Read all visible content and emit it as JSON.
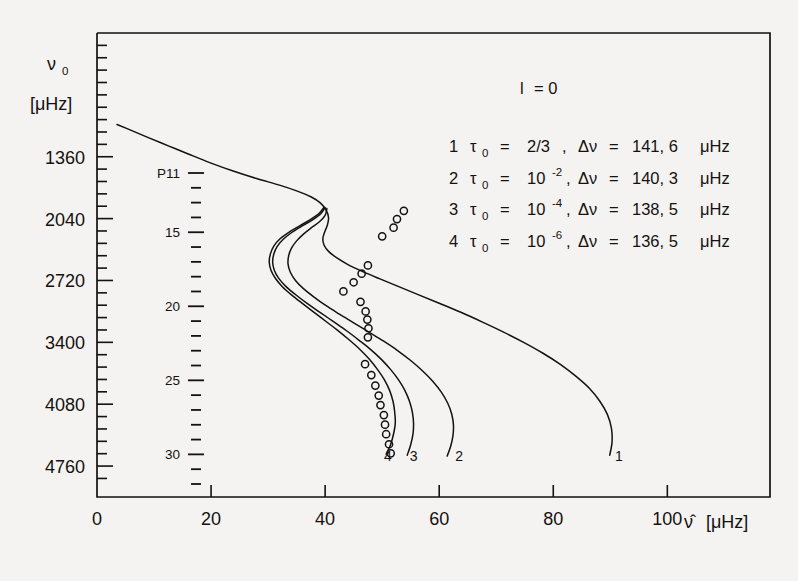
{
  "figure": {
    "background": "#f4f3f1",
    "ink": "#14110f"
  },
  "chart_data": {
    "type": "line",
    "title": "",
    "subtitle": "",
    "xlabel": "ν̂ [μHz]",
    "ylabel": "ν₀ [μHz]",
    "ylabel_line1": "ν",
    "ylabel_line1_sub": "0",
    "ylabel_line2": "[μHz]",
    "xlabel_hat": "ν̂",
    "xlabel_unit": "[μHz]",
    "xlim": [
      0,
      118
    ],
    "ylim": [
      0,
      5100
    ],
    "xticks": [
      0,
      20,
      40,
      60,
      80,
      100
    ],
    "xticklabels": [
      "0",
      "20",
      "40",
      "60",
      "80",
      "100"
    ],
    "yticks": [
      1360,
      2040,
      2720,
      3400,
      4080,
      4760
    ],
    "yticklabels": [
      "1360",
      "2040",
      "2720",
      "3400",
      "4080",
      "4760"
    ],
    "y_minor_step": 136,
    "grid": false,
    "legend_position": "upper-right-inside",
    "annotation_l": "l = 0",
    "inner_scale": {
      "name": "P11",
      "label_prefix": "P",
      "ticks": [
        11,
        12,
        13,
        14,
        15,
        16,
        17,
        18,
        19,
        20,
        21,
        22,
        23,
        24,
        25,
        26,
        27,
        28,
        29,
        30,
        31,
        32
      ],
      "labeled": [
        {
          "n": 11,
          "text": "P11"
        },
        {
          "n": 15,
          "text": "15"
        },
        {
          "n": 20,
          "text": "20"
        },
        {
          "n": 25,
          "text": "25"
        },
        {
          "n": 30,
          "text": "30"
        }
      ]
    },
    "series": [
      {
        "name": "1",
        "label": "1",
        "tau0": "2/3",
        "delta_nu": "141,6",
        "legend": "1  τ₀ = 2/3 ,  Δν = 141,6 μHz",
        "points": [
          [
            3.5,
            1005
          ],
          [
            6.0,
            1070
          ],
          [
            9.0,
            1150
          ],
          [
            12.5,
            1240
          ],
          [
            16.0,
            1330
          ],
          [
            20.0,
            1430
          ],
          [
            24.0,
            1520
          ],
          [
            28.0,
            1600
          ],
          [
            32.0,
            1672
          ],
          [
            35.0,
            1735
          ],
          [
            37.5,
            1800
          ],
          [
            39.2,
            1870
          ],
          [
            40.2,
            1950
          ],
          [
            40.6,
            2030
          ],
          [
            40.4,
            2110
          ],
          [
            39.9,
            2190
          ],
          [
            39.6,
            2260
          ],
          [
            39.8,
            2330
          ],
          [
            40.6,
            2400
          ],
          [
            42.0,
            2470
          ],
          [
            44.0,
            2545
          ],
          [
            46.5,
            2620
          ],
          [
            49.5,
            2700
          ],
          [
            52.8,
            2785
          ],
          [
            56.3,
            2875
          ],
          [
            60.0,
            2970
          ],
          [
            63.8,
            3070
          ],
          [
            67.5,
            3175
          ],
          [
            71.2,
            3285
          ],
          [
            74.8,
            3400
          ],
          [
            78.2,
            3520
          ],
          [
            81.3,
            3645
          ],
          [
            84.0,
            3775
          ],
          [
            86.4,
            3910
          ],
          [
            88.2,
            4050
          ],
          [
            89.5,
            4195
          ],
          [
            90.2,
            4345
          ],
          [
            90.3,
            4500
          ],
          [
            89.9,
            4640
          ]
        ]
      },
      {
        "name": "2",
        "label": "2",
        "tau0": "10⁻²",
        "delta_nu": "140,3",
        "legend": "2  τ₀ = 10⁻² ,  Δν = 140,3 μHz",
        "points": [
          [
            40.3,
            1930
          ],
          [
            40.0,
            2005
          ],
          [
            39.0,
            2075
          ],
          [
            37.6,
            2140
          ],
          [
            36.2,
            2210
          ],
          [
            35.0,
            2285
          ],
          [
            34.1,
            2365
          ],
          [
            33.6,
            2450
          ],
          [
            33.5,
            2540
          ],
          [
            33.9,
            2630
          ],
          [
            34.8,
            2720
          ],
          [
            36.2,
            2810
          ],
          [
            38.0,
            2900
          ],
          [
            40.1,
            2995
          ],
          [
            42.5,
            3090
          ],
          [
            45.0,
            3185
          ],
          [
            47.6,
            3285
          ],
          [
            50.2,
            3385
          ],
          [
            52.7,
            3490
          ],
          [
            55.0,
            3600
          ],
          [
            57.1,
            3715
          ],
          [
            58.9,
            3830
          ],
          [
            60.4,
            3950
          ],
          [
            61.5,
            4070
          ],
          [
            62.2,
            4190
          ],
          [
            62.5,
            4310
          ],
          [
            62.4,
            4430
          ],
          [
            62.0,
            4545
          ],
          [
            61.4,
            4650
          ]
        ]
      },
      {
        "name": "3",
        "label": "3",
        "tau0": "10⁻⁴",
        "delta_nu": "138,5",
        "legend": "3  τ₀ = 10⁻⁴ ,  Δν = 138,5 μHz",
        "points": [
          [
            40.0,
            1920
          ],
          [
            39.2,
            1990
          ],
          [
            37.8,
            2055
          ],
          [
            36.0,
            2120
          ],
          [
            34.2,
            2190
          ],
          [
            32.7,
            2265
          ],
          [
            31.6,
            2345
          ],
          [
            31.0,
            2430
          ],
          [
            30.8,
            2520
          ],
          [
            31.1,
            2610
          ],
          [
            31.9,
            2700
          ],
          [
            33.2,
            2790
          ],
          [
            34.9,
            2880
          ],
          [
            36.9,
            2975
          ],
          [
            39.1,
            3070
          ],
          [
            41.4,
            3170
          ],
          [
            43.7,
            3270
          ],
          [
            45.9,
            3375
          ],
          [
            48.0,
            3480
          ],
          [
            49.9,
            3590
          ],
          [
            51.5,
            3700
          ],
          [
            52.9,
            3815
          ],
          [
            54.0,
            3930
          ],
          [
            54.8,
            4050
          ],
          [
            55.3,
            4170
          ],
          [
            55.5,
            4290
          ],
          [
            55.4,
            4410
          ],
          [
            55.0,
            4525
          ],
          [
            54.4,
            4640
          ]
        ]
      },
      {
        "name": "4",
        "label": "4",
        "tau0": "10⁻⁶",
        "delta_nu": "136,5",
        "legend": "4  τ₀ = 10⁻⁶ ,  Δν = 136,5 μHz",
        "points": [
          [
            39.8,
            1915
          ],
          [
            38.9,
            1985
          ],
          [
            37.4,
            2050
          ],
          [
            35.6,
            2118
          ],
          [
            33.7,
            2188
          ],
          [
            32.1,
            2262
          ],
          [
            31.0,
            2342
          ],
          [
            30.4,
            2428
          ],
          [
            30.2,
            2518
          ],
          [
            30.5,
            2608
          ],
          [
            31.3,
            2698
          ],
          [
            32.5,
            2788
          ],
          [
            34.1,
            2878
          ],
          [
            36.0,
            2972
          ],
          [
            38.0,
            3068
          ],
          [
            40.1,
            3168
          ],
          [
            42.2,
            3268
          ],
          [
            44.2,
            3372
          ],
          [
            46.1,
            3478
          ],
          [
            47.8,
            3588
          ],
          [
            49.2,
            3700
          ],
          [
            50.4,
            3812
          ],
          [
            51.3,
            3928
          ],
          [
            51.9,
            4048
          ],
          [
            52.2,
            4168
          ],
          [
            52.3,
            4288
          ],
          [
            52.0,
            4405
          ],
          [
            51.5,
            4520
          ],
          [
            50.7,
            4630
          ]
        ]
      }
    ],
    "observations": {
      "name": "observed frequencies",
      "marker": "open-circle",
      "points": [
        [
          53.8,
          1955
        ],
        [
          52.6,
          2045
        ],
        [
          52.0,
          2140
        ],
        [
          50.0,
          2235
        ],
        [
          47.5,
          2555
        ],
        [
          46.4,
          2645
        ],
        [
          45.0,
          2740
        ],
        [
          43.2,
          2840
        ],
        [
          46.2,
          2955
        ],
        [
          47.1,
          3060
        ],
        [
          47.4,
          3150
        ],
        [
          47.6,
          3245
        ],
        [
          47.5,
          3345
        ],
        [
          47.0,
          3640
        ],
        [
          48.1,
          3760
        ],
        [
          48.8,
          3875
        ],
        [
          49.4,
          3985
        ],
        [
          49.7,
          4090
        ],
        [
          50.3,
          4200
        ],
        [
          50.5,
          4305
        ],
        [
          50.7,
          4410
        ],
        [
          51.2,
          4520
        ],
        [
          51.5,
          4620
        ]
      ]
    }
  },
  "legend": {
    "header": "l = 0",
    "header_symbol": "l",
    "header_eq": "= 0",
    "rows": [
      {
        "index": "1",
        "tau_sym": "τ",
        "tau_sub": "0",
        "eq1": "=",
        "tau_val": "2/3",
        "comma": ",",
        "delta_sym": "Δν",
        "eq2": "=",
        "dnu_val": "141, 6",
        "unit": "μHz",
        "exp": ""
      },
      {
        "index": "2",
        "tau_sym": "τ",
        "tau_sub": "0",
        "eq1": "=",
        "tau_val": "10",
        "comma": ",",
        "delta_sym": "Δν",
        "eq2": "=",
        "dnu_val": "140, 3",
        "unit": "μHz",
        "exp": "-2"
      },
      {
        "index": "3",
        "tau_sym": "τ",
        "tau_sub": "0",
        "eq1": "=",
        "tau_val": "10",
        "comma": ",",
        "delta_sym": "Δν",
        "eq2": "=",
        "dnu_val": "138, 5",
        "unit": "μHz",
        "exp": "-4"
      },
      {
        "index": "4",
        "tau_sym": "τ",
        "tau_sub": "0",
        "eq1": "=",
        "tau_val": "10",
        "comma": ",",
        "delta_sym": "Δν",
        "eq2": "=",
        "dnu_val": "136, 5",
        "unit": "μHz",
        "exp": "-6"
      }
    ]
  },
  "curve_end_labels": [
    {
      "label": "4",
      "x": 51.0,
      "y": 4700
    },
    {
      "label": "3",
      "x": 55.5,
      "y": 4700
    },
    {
      "label": "2",
      "x": 63.5,
      "y": 4700
    },
    {
      "label": "1",
      "x": 91.5,
      "y": 4700
    }
  ]
}
